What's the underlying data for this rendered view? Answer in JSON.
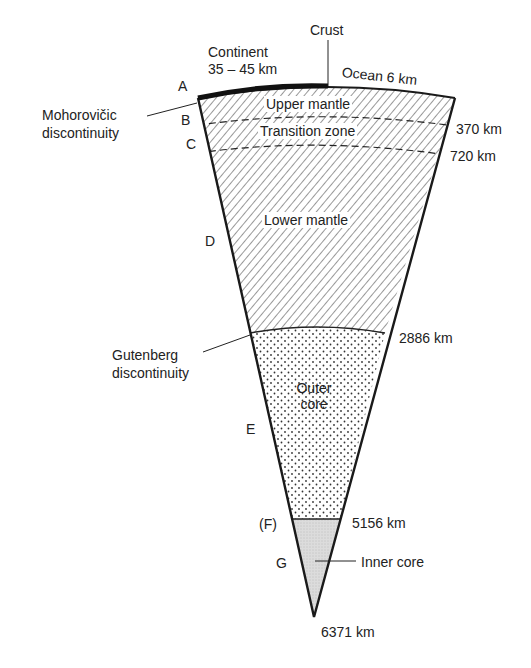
{
  "crust": {
    "label": "Crust",
    "continent_label": "Continent",
    "continent_thickness": "35 – 45 km",
    "ocean_label": "Ocean 6 km"
  },
  "layers": [
    {
      "name": "Upper mantle",
      "letter": "B",
      "pattern": "hatch"
    },
    {
      "name": "Transition zone",
      "letter": "C",
      "pattern": "hatch"
    },
    {
      "name": "Lower mantle",
      "letter": "D",
      "pattern": "hatch"
    },
    {
      "name_line1": "Outer",
      "name_line2": "core",
      "letter": "E",
      "pattern": "dots"
    },
    {
      "name": "Inner core",
      "letter": "G",
      "pattern": "stipple"
    }
  ],
  "letters": {
    "a": "A",
    "b": "B",
    "c": "C",
    "d": "D",
    "e": "E",
    "f": "(F)",
    "g": "G"
  },
  "depths": {
    "d370": "370 km",
    "d720": "720 km",
    "d2886": "2886 km",
    "d5156": "5156 km",
    "d6371": "6371 km"
  },
  "discontinuities": {
    "moho_line1": "Mohorovičic",
    "moho_line2": "discontinuity",
    "gutenberg_line1": "Gutenberg",
    "gutenberg_line2": "discontinuity"
  },
  "colors": {
    "line": "#1a1a1a",
    "inner_core_fill": "#d9d9d9",
    "background": "#ffffff"
  }
}
